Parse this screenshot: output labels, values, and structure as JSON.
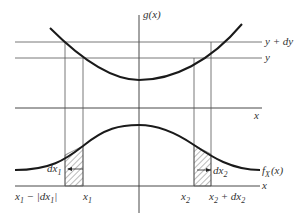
{
  "diagram": {
    "type": "transformation-of-random-variable",
    "colors": {
      "line": "#555555",
      "curve": "#1a1a1a",
      "text": "#333333",
      "hatch": "#555555"
    },
    "top_panel": {
      "y_axis_label": "g(x)",
      "level_labels": {
        "upper": "y + dy",
        "lower": "y"
      },
      "x_axis_label": "x",
      "curve": "g(x)"
    },
    "bottom_panel": {
      "curve_label_main": "f",
      "curve_label_sub": "X",
      "curve_label_arg": "(x)",
      "x_axis_label": "x",
      "interval_labels": {
        "dx1_main": "dx",
        "dx1_sub": "1",
        "dx2_main": "dx",
        "dx2_sub": "2"
      },
      "tick_labels": {
        "left_outer": {
          "a": "x",
          "a_sub": "1",
          "b": " − |dx",
          "b_sub": "1",
          "c": "|"
        },
        "left_inner": {
          "a": "x",
          "a_sub": "1"
        },
        "right_inner": {
          "a": "x",
          "a_sub": "2"
        },
        "right_outer": {
          "a": "x",
          "a_sub": "2",
          "b": " + dx",
          "b_sub": "2"
        }
      }
    }
  }
}
